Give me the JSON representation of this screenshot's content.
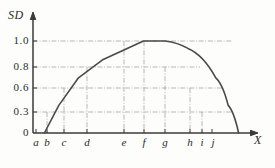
{
  "chart_data": {
    "type": "line",
    "title": "",
    "xlabel": "X",
    "ylabel": "SD",
    "grid": true,
    "legend": "none",
    "xlim": [
      0,
      10.6
    ],
    "ylim": [
      0,
      1.15
    ],
    "x_tick_labels": [
      "a",
      "b",
      "c",
      "d",
      "e",
      "f",
      "g",
      "h",
      "i",
      "j"
    ],
    "x_tick_positions": [
      0.55,
      1.25,
      2.2,
      3.4,
      5.35,
      6.4,
      7.5,
      8.85,
      9.45,
      9.95
    ],
    "y_tick_labels": [
      "0",
      "0.3",
      "0.6",
      "0.8",
      "1.0"
    ],
    "y_tick_values": [
      0,
      0.3,
      0.6,
      0.8,
      1.0
    ],
    "gridline_y_values": [
      0.3,
      0.6,
      0.8,
      1.0
    ],
    "gridline_x_labels": [
      "b",
      "c",
      "d",
      "e",
      "f",
      "g",
      "h",
      "i"
    ],
    "series": [
      {
        "name": "SD curve",
        "color": "#4a4a4a",
        "x": [
          0.55,
          1.25,
          2.2,
          3.4,
          5.35,
          6.4,
          7.5,
          8.85,
          9.45,
          9.95
        ],
        "values": [
          0.0,
          0.3,
          0.6,
          0.8,
          1.0,
          1.0,
          0.92,
          0.6,
          0.3,
          0.0
        ],
        "point_labels": [
          "a",
          "b",
          "c",
          "d",
          "e",
          "f",
          "g",
          "h",
          "i",
          "j"
        ]
      }
    ],
    "annotations": [
      {
        "text": "plateau between e and f at SD = 1.0"
      },
      {
        "text": "curve starts at a with SD = 0"
      },
      {
        "text": "curve ends at j with SD = 0"
      }
    ]
  },
  "axes": {
    "y_title": "SD",
    "x_title": "X"
  },
  "caption": {
    "text": ""
  },
  "colors": {
    "curve": "#4a4a4a",
    "axis": "#3a3a3a",
    "grid": "#9a9a9a",
    "text": "#2b2b2b"
  }
}
